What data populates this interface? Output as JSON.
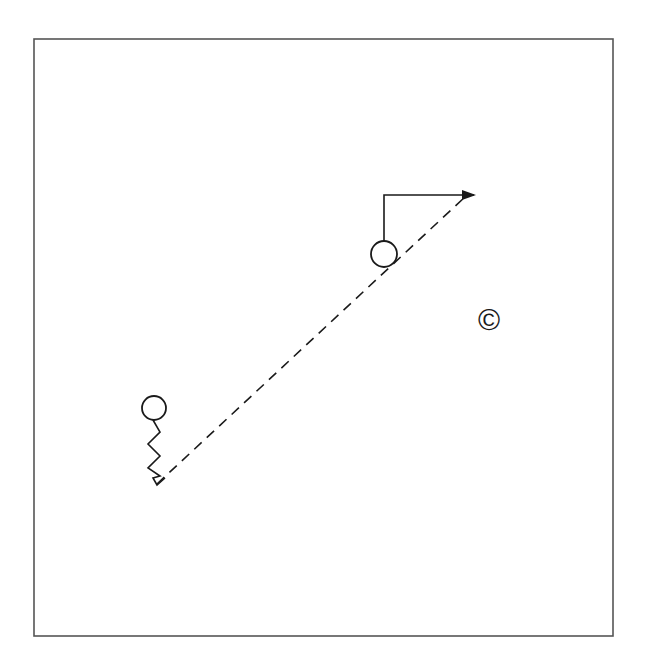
{
  "diagram": {
    "type": "play-diagram",
    "frame": {
      "x": 34,
      "y": 39,
      "width": 579,
      "height": 597,
      "stroke": "#555555"
    },
    "players": [
      {
        "id": "player-lower-left",
        "cx": 154,
        "cy": 408,
        "r": 12
      },
      {
        "id": "player-upper-right",
        "cx": 384,
        "cy": 254,
        "r": 13
      }
    ],
    "zigzag_path": {
      "from_player": "player-lower-left",
      "points": "153,420 160,432 148,444 160,456 148,468 160,476 153,478 157,485 165,478"
    },
    "pass_line": {
      "style": "dashed",
      "from": {
        "x": 157,
        "y": 484
      },
      "to": {
        "x": 465,
        "y": 197
      }
    },
    "route_arrow": {
      "from_player": "player-upper-right",
      "vertical_top_y": 195,
      "x": 384,
      "end_x": 476
    },
    "copyright": {
      "symbol": "©",
      "x": 478,
      "y": 305
    },
    "stroke_color": "#1a1a1a"
  }
}
